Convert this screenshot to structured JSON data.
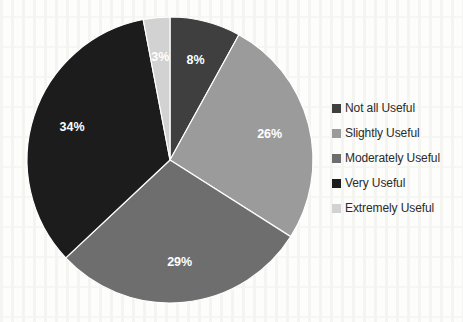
{
  "chart_data": {
    "type": "pie",
    "title": "",
    "categories": [
      "Not all Useful",
      "Slightly Useful",
      "Moderately Useful",
      "Very Useful",
      "Extremely Useful"
    ],
    "values": [
      8,
      26,
      29,
      34,
      3
    ],
    "unit": "%",
    "data_labels": [
      "8%",
      "26%",
      "29%",
      "34%",
      "3%"
    ],
    "colors": [
      "#3f3f3f",
      "#9b9b9b",
      "#6e6e6e",
      "#1c1c1c",
      "#d2d2d2"
    ],
    "legend_position": "right",
    "grid": false,
    "slices": [
      {
        "label": "Not all Useful",
        "value": 8,
        "display": "8%",
        "color": "#3f3f3f"
      },
      {
        "label": "Slightly Useful",
        "value": 26,
        "display": "26%",
        "color": "#9b9b9b"
      },
      {
        "label": "Moderately Useful",
        "value": 29,
        "display": "29%",
        "color": "#6e6e6e"
      },
      {
        "label": "Very Useful",
        "value": 34,
        "display": "34%",
        "color": "#1c1c1c"
      },
      {
        "label": "Extremely Useful",
        "value": 3,
        "display": "3%",
        "color": "#d2d2d2"
      }
    ]
  },
  "legend": {
    "items": [
      {
        "label": "Not all Useful",
        "color": "#3f3f3f"
      },
      {
        "label": "Slightly Useful",
        "color": "#9b9b9b"
      },
      {
        "label": "Moderately Useful",
        "color": "#6e6e6e"
      },
      {
        "label": "Very Useful",
        "color": "#1c1c1c"
      },
      {
        "label": "Extremely Useful",
        "color": "#d2d2d2"
      }
    ]
  },
  "geometry": {
    "center_x": 170,
    "center_y": 160,
    "radius": 143,
    "label_radius_ratio": 0.72,
    "start_angle_deg": -90
  }
}
